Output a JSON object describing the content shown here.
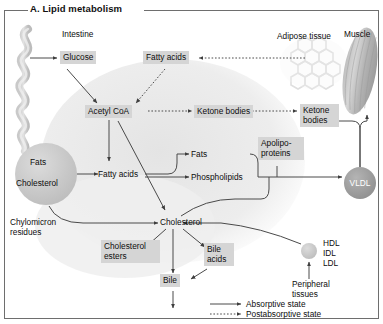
{
  "figure": {
    "title": "A. Lipid metabolism"
  },
  "organs": {
    "intestine": "Intestine",
    "adipose": "Adipose tissue",
    "muscle": "Muscle",
    "peripheral": "Peripheral tissues"
  },
  "nodes": {
    "glucose": "Glucose",
    "fatty_acids_top": "Fatty acids",
    "acetyl_coa": "Acetyl CoA",
    "ketone_bodies_liver": "Ketone bodies",
    "ketone_bodies_blood_l1": "Ketone",
    "ketone_bodies_blood_l2": "bodies",
    "fats_circle": "Fats",
    "cholesterol_circle": "Cholesterol",
    "chylomicron_l1": "Chylomicron",
    "chylomicron_l2": "residues",
    "fatty_acids_mid": "Fatty acids",
    "fats": "Fats",
    "phospholipids": "Phospholipids",
    "apolipoproteins_l1": "Apolipo-",
    "apolipoproteins_l2": "proteins",
    "vldl": "VLDL",
    "cholesterol": "Cholesterol",
    "cholesterol_esters_l1": "Cholesterol",
    "cholesterol_esters_l2": "esters",
    "bile_acids_l1": "Bile",
    "bile_acids_l2": "acids",
    "bile": "Bile",
    "hdl": "HDL",
    "idl": "IDL",
    "ldl": "LDL"
  },
  "legend": {
    "absorptive": "Absorptive state",
    "postabsorptive": "Postabsorptive state"
  },
  "colors": {
    "box_fill": "#d5d5d5",
    "circle_light": "#cfcfcf",
    "circle_dark": "#a2a2a2",
    "tissue_gray": "#d9d9d9",
    "stroke": "#4a4a4a",
    "frame": "#6e6e6e",
    "text": "#0d0d0d"
  }
}
